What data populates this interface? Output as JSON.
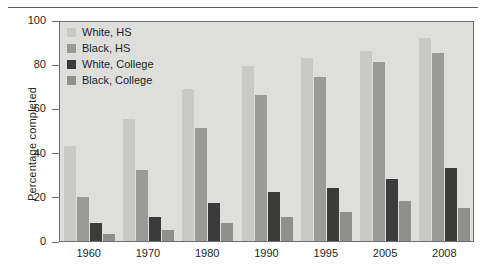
{
  "chart_data": {
    "type": "bar",
    "title": "",
    "xlabel": "",
    "ylabel": "Percentage completed",
    "ylim": [
      0,
      100
    ],
    "yticks": [
      0,
      20,
      40,
      60,
      80,
      100
    ],
    "grid": false,
    "legend_position": "top-left",
    "categories": [
      "1960",
      "1970",
      "1980",
      "1990",
      "1995",
      "2005",
      "2008"
    ],
    "series": [
      {
        "name": "White, HS",
        "color": "#c9c9c7",
        "values": [
          43,
          55,
          69,
          79,
          83,
          86,
          92
        ]
      },
      {
        "name": "Black, HS",
        "color": "#9a9a98",
        "values": [
          20,
          32,
          51,
          66,
          74,
          81,
          85
        ]
      },
      {
        "name": "White, College",
        "color": "#3b3b3b",
        "values": [
          8,
          11,
          17,
          22,
          24,
          28,
          33
        ]
      },
      {
        "name": "Black, College",
        "color": "#8f8f8d",
        "values": [
          3,
          5,
          8,
          11,
          13,
          18,
          15
        ]
      }
    ]
  },
  "figure": {
    "plot_background": "#dededd",
    "axis_color": "#6e6e6e",
    "text_color": "#231f20"
  }
}
